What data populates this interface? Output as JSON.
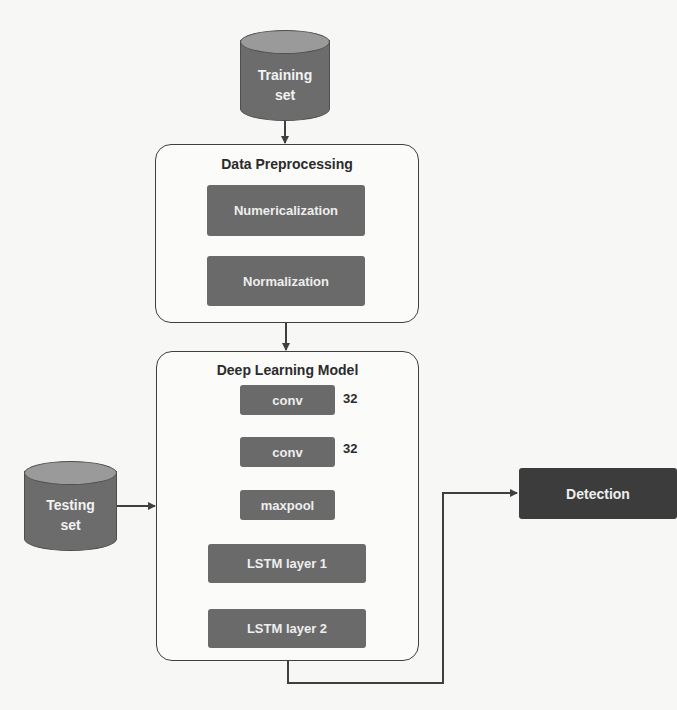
{
  "diagram": {
    "training_set": {
      "label": "Training\nset",
      "icon": "database-cylinder-icon"
    },
    "testing_set": {
      "label": "Testing\nset",
      "icon": "database-cylinder-icon"
    },
    "data_preprocessing": {
      "title": "Data Preprocessing",
      "steps": [
        {
          "label": "Numericalization"
        },
        {
          "label": "Normalization"
        }
      ]
    },
    "deep_learning_model": {
      "title": "Deep Learning Model",
      "layers": [
        {
          "label": "conv",
          "annotation": "32"
        },
        {
          "label": "conv",
          "annotation": "32"
        },
        {
          "label": "maxpool"
        },
        {
          "label": "LSTM layer 1"
        },
        {
          "label": "LSTM layer 2"
        }
      ]
    },
    "output": {
      "label": "Detection"
    },
    "colors": {
      "block_fill": "#6a6a6a",
      "output_fill": "#3c3c3c",
      "cylinder_body": "#6c6c6c",
      "cylinder_top": "#9a9a9a",
      "line": "#3f3f3f",
      "background": "#f7f7f5"
    }
  }
}
